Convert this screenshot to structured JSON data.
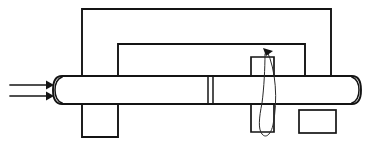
{
  "figure": {
    "background_color": "#ffffff",
    "line_color": "#141414",
    "width": 375,
    "height": 146
  },
  "elements": {
    "outer_frame": {
      "name": "outer-frame",
      "label": "Outer frame",
      "points": "82,9 331,9 331,77",
      "left_leg": "82,9 82,77"
    },
    "inner_frame": {
      "name": "inner-frame",
      "label": "Inner frame cutout",
      "points": "118,77 118,44 305,44 305,77"
    },
    "inner_frame_notch": {
      "name": "inner-frame-notch",
      "label": "Inner frame right notch",
      "points": "305,44 305,77 331,77"
    },
    "bar": {
      "name": "horizontal-bar",
      "label": "Horizontal bar / shaft",
      "x": 55,
      "y": 76,
      "width": 306,
      "height": 28,
      "left_cap_rounded": true,
      "right_cap_rounded": true
    },
    "bar_seam": {
      "name": "bar-seam",
      "label": "Bar joint seam",
      "x1": 208,
      "x2": 213
    },
    "left_block": {
      "name": "left-support-block",
      "label": "Left support block",
      "x": 82,
      "y": 104,
      "width": 36,
      "height": 33
    },
    "center_block_upper": {
      "name": "center-block-upper",
      "label": "Center block above bar",
      "x": 251,
      "y": 57,
      "width": 23,
      "height": 19
    },
    "center_block_lower": {
      "name": "center-block-lower",
      "label": "Center block below bar",
      "x": 251,
      "y": 104,
      "width": 23,
      "height": 28
    },
    "right_block": {
      "name": "right-detached-block",
      "label": "Detached lower right block",
      "x": 299,
      "y": 110,
      "width": 37,
      "height": 23
    }
  },
  "annotations": {
    "load_arrows": {
      "name": "load-arrows",
      "label": "Applied load arrows",
      "count": 2,
      "direction": "right",
      "arrows": [
        {
          "name": "load-arrow-top",
          "x1": 10,
          "y1": 85,
          "x2": 52,
          "y2": 85
        },
        {
          "name": "load-arrow-bottom",
          "x1": 10,
          "y1": 96,
          "x2": 52,
          "y2": 96
        }
      ]
    },
    "torsion_arrow": {
      "name": "torsion-arrow",
      "label": "Torsion / rotation arrow",
      "direction": "counter-clockwise",
      "center_x": 268,
      "top_y": 49,
      "bottom_y": 138,
      "loop_width": 18
    }
  }
}
